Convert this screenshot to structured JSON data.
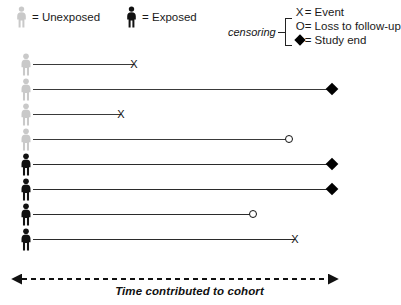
{
  "legend": {
    "unexposed": {
      "icon": "person-icon-light",
      "label": "= Unexposed",
      "color": "#c9c9c9"
    },
    "exposed": {
      "icon": "person-icon-dark",
      "label": "= Exposed",
      "color": "#111111"
    },
    "censoring": {
      "bracket_label": "censoring",
      "items": [
        {
          "symbol": "X",
          "icon": "x-mark-icon",
          "label": "= Event"
        },
        {
          "symbol": "O",
          "icon": "open-circle-icon",
          "label": "= Loss to follow-up"
        },
        {
          "symbol": "◆",
          "icon": "diamond-icon",
          "label": "= Study end"
        }
      ]
    }
  },
  "axis": {
    "label": "Time contributed to cohort",
    "style": "dashed-double-arrow",
    "start_x": 17,
    "end_x": 333
  },
  "chart_data": {
    "type": "timeline",
    "title": "",
    "xlabel": "Time contributed to cohort",
    "ylabel": "",
    "xlim": [
      17,
      333
    ],
    "grid": false,
    "legend_position": "top",
    "groups": [
      "Unexposed",
      "Exposed"
    ],
    "endpoint_types": {
      "X": "Event",
      "O": "Loss to follow-up",
      "D": "Study end"
    },
    "subjects": [
      {
        "id": 1,
        "group": "Unexposed",
        "start": 33,
        "end": 134,
        "endpoint": "X",
        "length": 101
      },
      {
        "id": 2,
        "group": "Unexposed",
        "start": 33,
        "end": 332,
        "endpoint": "D",
        "length": 299
      },
      {
        "id": 3,
        "group": "Unexposed",
        "start": 33,
        "end": 121,
        "endpoint": "X",
        "length": 88
      },
      {
        "id": 4,
        "group": "Unexposed",
        "start": 33,
        "end": 289,
        "endpoint": "O",
        "length": 256
      },
      {
        "id": 5,
        "group": "Exposed",
        "start": 33,
        "end": 332,
        "endpoint": "D",
        "length": 299
      },
      {
        "id": 6,
        "group": "Exposed",
        "start": 33,
        "end": 332,
        "endpoint": "D",
        "length": 299
      },
      {
        "id": 7,
        "group": "Exposed",
        "start": 33,
        "end": 253,
        "endpoint": "O",
        "length": 220
      },
      {
        "id": 8,
        "group": "Exposed",
        "start": 33,
        "end": 295,
        "endpoint": "X",
        "length": 262
      }
    ],
    "row_tops": [
      52,
      77,
      102,
      127,
      152,
      177,
      202,
      227
    ]
  }
}
